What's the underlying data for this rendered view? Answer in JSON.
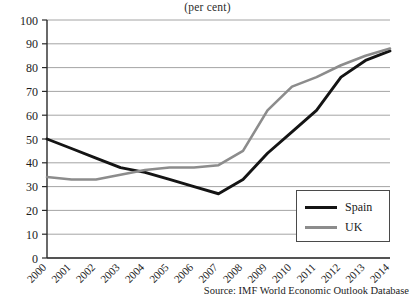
{
  "chart_data": {
    "type": "line",
    "title": "(per cent)",
    "xlabel": "",
    "ylabel": "",
    "ylim": [
      0,
      100
    ],
    "ytick_step": 10,
    "yticks": [
      "0",
      "10",
      "20",
      "30",
      "40",
      "50",
      "60",
      "70",
      "80",
      "90",
      "100"
    ],
    "grid": true,
    "legend_position": "bottom-right",
    "categories": [
      "2000",
      "2001",
      "2002",
      "2003",
      "2004",
      "2005",
      "2006",
      "2007",
      "2008",
      "2009",
      "2010",
      "2011",
      "2012",
      "2013",
      "2014"
    ],
    "series": [
      {
        "name": "Spain",
        "color": "#141414",
        "values": [
          50,
          46,
          42,
          38,
          36,
          33,
          30,
          27,
          33,
          44,
          53,
          62,
          76,
          83,
          87
        ]
      },
      {
        "name": "UK",
        "color": "#8c8c8c",
        "values": [
          34,
          33,
          33,
          35,
          37,
          38,
          38,
          39,
          45,
          62,
          72,
          76,
          81,
          85,
          88
        ]
      }
    ],
    "source": "Source: IMF World Economic Outlook Database"
  },
  "legend": {
    "entries": [
      {
        "label": "Spain"
      },
      {
        "label": "UK"
      }
    ]
  },
  "colors": {
    "spain": "#141414",
    "uk": "#8c8c8c",
    "grid": "#8d8d8d",
    "axis": "#2a2a2a"
  }
}
